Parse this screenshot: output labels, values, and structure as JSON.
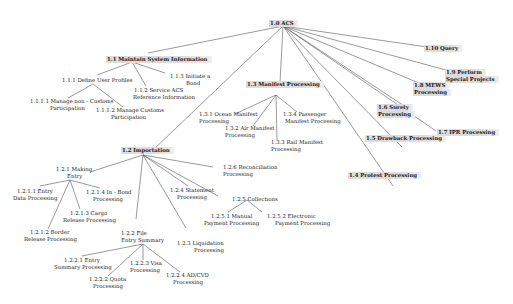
{
  "diagram": {
    "root": {
      "id": "1.0",
      "label": "1.0 ACS"
    },
    "nodes": [
      {
        "id": "1.1",
        "label": "1.1   Maintain    System    Information"
      },
      {
        "id": "1.1.1",
        "label": "1.1.1     Define     User    Profiles"
      },
      {
        "id": "1.1.1.1a",
        "label": "1.1.1.1 Manage            non  - Customs"
      },
      {
        "id": "1.1.1.1b",
        "label": "Participation"
      },
      {
        "id": "1.1.1.2a",
        "label": "1.1.1.2 Manage            Customs"
      },
      {
        "id": "1.1.1.2b",
        "label": "Participation"
      },
      {
        "id": "1.1.2a",
        "label": "1.1.2 Service ACS"
      },
      {
        "id": "1.1.2b",
        "label": "Reference      Information"
      },
      {
        "id": "1.1.3a",
        "label": "1.1.3     Initiate     a"
      },
      {
        "id": "1.1.3b",
        "label": "Bond"
      },
      {
        "id": "1.2",
        "label": "1.2   Importation"
      },
      {
        "id": "1.2.1a",
        "label": "1.2.1      Making"
      },
      {
        "id": "1.2.1b",
        "label": "Entry"
      },
      {
        "id": "1.2.1.1a",
        "label": "1.2.1.1 Entry"
      },
      {
        "id": "1.2.1.1b",
        "label": "Data Processing"
      },
      {
        "id": "1.2.1.2a",
        "label": "1.2.1.2 Border"
      },
      {
        "id": "1.2.1.2b",
        "label": "Release Processing"
      },
      {
        "id": "1.2.1.3a",
        "label": "1.2.1.3 Cargo"
      },
      {
        "id": "1.2.1.3b",
        "label": "Release Processing"
      },
      {
        "id": "1.2.1.4a",
        "label": "1.2.1.4        In - Bond"
      },
      {
        "id": "1.2.1.4b",
        "label": "Processing"
      },
      {
        "id": "1.2.2a",
        "label": "1.2.2 File"
      },
      {
        "id": "1.2.2b",
        "label": "Entry    Summary"
      },
      {
        "id": "1.2.2.1a",
        "label": "1.2.2.1 Entry"
      },
      {
        "id": "1.2.2.1b",
        "label": "Summary       Processing"
      },
      {
        "id": "1.2.2.2a",
        "label": "1.2.2.2 Quota"
      },
      {
        "id": "1.2.2.2b",
        "label": "Processing"
      },
      {
        "id": "1.2.2.3a",
        "label": "1.2.2.3 Visa"
      },
      {
        "id": "1.2.2.3b",
        "label": "Processing"
      },
      {
        "id": "1.2.2.4a",
        "label": "1.2.2.4 AD/CVD"
      },
      {
        "id": "1.2.2.4b",
        "label": "Processing"
      },
      {
        "id": "1.2.3a",
        "label": "1.2.3     Liquidation"
      },
      {
        "id": "1.2.3b",
        "label": "Processing"
      },
      {
        "id": "1.2.4a",
        "label": "1.2.4 Statement"
      },
      {
        "id": "1.2.4b",
        "label": "Processing"
      },
      {
        "id": "1.2.5",
        "label": "1.2.5       Collections"
      },
      {
        "id": "1.2.5.1a",
        "label": "1.2.5.1       Manual"
      },
      {
        "id": "1.2.5.1b",
        "label": "Payment      Processing"
      },
      {
        "id": "1.2.5.2a",
        "label": "1.2.5.2 Electronic"
      },
      {
        "id": "1.2.5.2b",
        "label": "Payment       Processing"
      },
      {
        "id": "1.2.6a",
        "label": "1.2.6      Reconciliation"
      },
      {
        "id": "1.2.6b",
        "label": "Processing"
      },
      {
        "id": "1.3",
        "label": "1.3 Manifest Processing"
      },
      {
        "id": "1.3.1a",
        "label": "1.3.1     Ocean      Manifest"
      },
      {
        "id": "1.3.1b",
        "label": "Processing"
      },
      {
        "id": "1.3.2a",
        "label": "1.3.2 Air Manifest"
      },
      {
        "id": "1.3.2b",
        "label": "Processing"
      },
      {
        "id": "1.3.3a",
        "label": "1.3.3 Rail Manifest"
      },
      {
        "id": "1.3.3b",
        "label": "Processing"
      },
      {
        "id": "1.3.4a",
        "label": "1.3.4 Passenger"
      },
      {
        "id": "1.3.4b",
        "label": "Manifest Processing"
      },
      {
        "id": "1.4",
        "label": "1.4 Protest Processing"
      },
      {
        "id": "1.5",
        "label": "1.5 Drawback Processing"
      },
      {
        "id": "1.6a",
        "label": "1.6    Surety"
      },
      {
        "id": "1.6b",
        "label": "Processing"
      },
      {
        "id": "1.7",
        "label": "1.7 IPR Processing"
      },
      {
        "id": "1.8a",
        "label": "1.8 MEWS"
      },
      {
        "id": "1.8b",
        "label": "Processing"
      },
      {
        "id": "1.9a",
        "label": "1.9     Perform"
      },
      {
        "id": "1.9b",
        "label": "Special     Projects"
      },
      {
        "id": "1.10",
        "label": "1.10 Query"
      }
    ]
  }
}
